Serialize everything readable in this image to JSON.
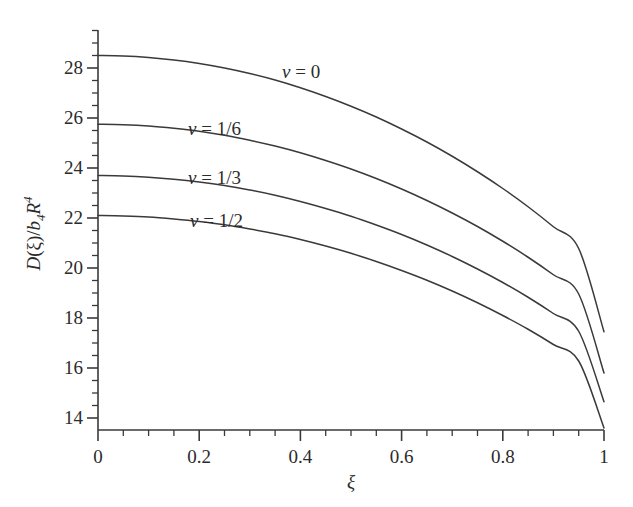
{
  "chart_data": {
    "type": "line",
    "title": "",
    "subtitle": "",
    "xlabel": "ξ",
    "ylabel": "D(ξ)/b₄R⁴",
    "xlim": [
      0,
      1
    ],
    "ylim": [
      13.3,
      29.3
    ],
    "grid": false,
    "legend_position": "inline-curve-labels",
    "x_ticks": [
      "0",
      "0.2",
      "0.4",
      "0.6",
      "0.8",
      "1"
    ],
    "x_tick_values": [
      0,
      0.2,
      0.4,
      0.6,
      0.8,
      1
    ],
    "x_minor_step": 0.05,
    "y_ticks": [
      "14",
      "16",
      "18",
      "20",
      "22",
      "24",
      "26",
      "28"
    ],
    "y_tick_values": [
      14,
      16,
      18,
      20,
      22,
      24,
      26,
      28
    ],
    "y_minor_step": 0.5,
    "x": [
      0,
      0.05,
      0.1,
      0.15,
      0.2,
      0.25,
      0.3,
      0.35,
      0.4,
      0.45,
      0.5,
      0.55,
      0.6,
      0.65,
      0.7,
      0.75,
      0.8,
      0.85,
      0.9,
      0.95,
      1
    ],
    "series": [
      {
        "name": "ν = 0",
        "label": "v = 0",
        "color": "#3a3a3a",
        "values": [
          28.5,
          28.48,
          28.42,
          28.32,
          28.18,
          28.0,
          27.78,
          27.52,
          27.21,
          26.86,
          26.47,
          26.04,
          25.56,
          25.04,
          24.47,
          23.85,
          23.18,
          22.45,
          21.65,
          20.78,
          17.45
        ]
      },
      {
        "name": "ν = 1/6",
        "label": "v = 1/6",
        "color": "#3a3a3a",
        "values": [
          25.75,
          25.73,
          25.68,
          25.59,
          25.47,
          25.31,
          25.11,
          24.88,
          24.61,
          24.3,
          23.96,
          23.58,
          23.16,
          22.7,
          22.2,
          21.66,
          21.07,
          20.43,
          19.73,
          18.96,
          15.8
        ]
      },
      {
        "name": "ν = 1/3",
        "label": "v = 1/3",
        "color": "#3a3a3a",
        "values": [
          23.7,
          23.68,
          23.63,
          23.55,
          23.44,
          23.3,
          23.12,
          22.91,
          22.66,
          22.38,
          22.07,
          21.72,
          21.34,
          20.92,
          20.46,
          19.96,
          19.42,
          18.83,
          18.18,
          17.47,
          14.65
        ]
      },
      {
        "name": "ν = 1/2",
        "label": "v = 1/2",
        "color": "#3a3a3a",
        "values": [
          22.1,
          22.08,
          22.04,
          21.96,
          21.86,
          21.73,
          21.56,
          21.37,
          21.14,
          20.88,
          20.59,
          20.26,
          19.9,
          19.51,
          19.08,
          18.61,
          18.1,
          17.55,
          16.94,
          16.28,
          13.6
        ]
      }
    ],
    "curve_labels": [
      {
        "text": "v = 0",
        "nu": "v",
        "rest": " = 0",
        "x_px": 282,
        "y_px": 62
      },
      {
        "text": "v = 1/6",
        "nu": "v",
        "rest": " = 1/6",
        "x_px": 188,
        "y_px": 119
      },
      {
        "text": "v = 1/3",
        "nu": "v",
        "rest": " = 1/3",
        "x_px": 188,
        "y_px": 168
      },
      {
        "text": "v = 1/2",
        "nu": "v",
        "rest": " = 1/2",
        "x_px": 190,
        "y_px": 211
      }
    ]
  },
  "axes": {
    "y_title_main": "D",
    "y_title_arg": "(ξ)/",
    "y_title_b": "b",
    "y_title_b_sub": "4",
    "y_title_R": "R",
    "y_title_R_sup": "4",
    "x_title": "ξ"
  },
  "style": {
    "line_color": "#3a3a3a",
    "axis_color": "#3a3a3a",
    "text_color": "#2b2b2b",
    "background": "#ffffff"
  }
}
